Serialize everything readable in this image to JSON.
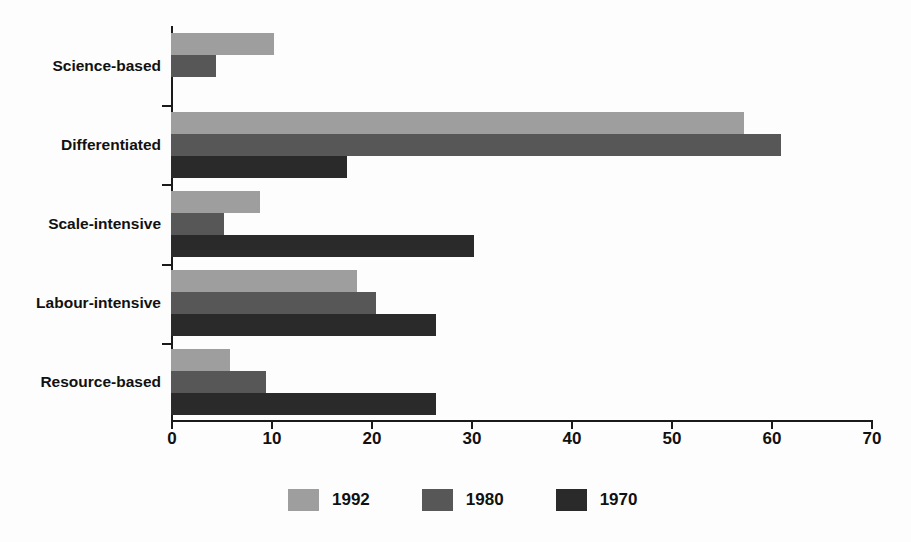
{
  "chart_data": {
    "type": "bar",
    "orientation": "horizontal",
    "title": "",
    "subtitle": "",
    "xlabel": "",
    "ylabel": "",
    "categories": [
      "Science-based",
      "Differentiated",
      "Scale-intensive",
      "Labour-intensive",
      "Resource-based"
    ],
    "series": [
      {
        "name": "1992",
        "color": "#9e9e9e",
        "values": [
          10.3,
          57.3,
          8.9,
          18.6,
          5.9
        ]
      },
      {
        "name": "1980",
        "color": "#575757",
        "values": [
          4.5,
          61.0,
          5.3,
          20.5,
          9.5
        ]
      },
      {
        "name": "1970",
        "color": "#2a2a2a",
        "values": [
          0.0,
          17.6,
          30.3,
          26.5,
          26.5
        ]
      }
    ],
    "xticks": [
      0,
      10,
      20,
      30,
      40,
      50,
      60,
      70
    ],
    "xtick_labels": [
      "0",
      "10",
      "20",
      "30",
      "40",
      "50",
      "60",
      "70"
    ],
    "xlim": [
      0,
      70
    ],
    "grid": false,
    "legend_position": "bottom-center",
    "legend_entries": [
      "1992",
      "1980",
      "1970"
    ]
  },
  "axis": {
    "line_color": "#1a1a1a"
  }
}
